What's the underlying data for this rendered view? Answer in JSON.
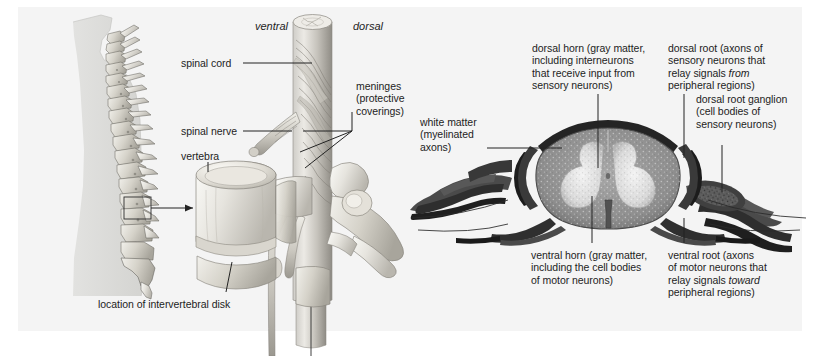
{
  "figure": {
    "type": "anatomical-diagram",
    "background_color": "#f4f4f4",
    "page_color": "#ffffff",
    "text_color": "#1d1d1d",
    "line_color": "#232323"
  },
  "panels": {
    "left": {
      "name": "body-silhouette-with-vertebral-column",
      "caption": "location of intervertebral disk"
    },
    "middle": {
      "name": "vertebra-and-spinal-cord-illustration",
      "orientation_left": "ventral",
      "orientation_right": "dorsal",
      "labels": {
        "spinal_cord": "spinal cord",
        "spinal_nerve": "spinal nerve",
        "vertebra": "vertebra",
        "meninges": "meninges\n(protective\ncoverings)"
      }
    },
    "right": {
      "name": "spinal-cord-cross-section-micrograph",
      "labels": {
        "dorsal_horn": "dorsal horn (gray matter,\nincluding interneurons\nthat receive input from\nsensory neurons)",
        "dorsal_root": "dorsal root (axons of\nsensory neurons that\nrelay signals ",
        "dorsal_root_em": "from",
        "dorsal_root_tail": "\nperipheral regions)",
        "dorsal_root_ganglion": "dorsal root ganglion\n(cell bodies of\nsensory neurons)",
        "white_matter": "white matter\n(myelinated\naxons)",
        "ventral_horn": "ventral horn (gray matter,\nincluding the cell bodies\nof motor neurons)",
        "ventral_root": "ventral root (axons\nof motor neurons that\nrelay signals ",
        "ventral_root_em": "toward",
        "ventral_root_tail": "\nperipheral regions)"
      }
    }
  }
}
